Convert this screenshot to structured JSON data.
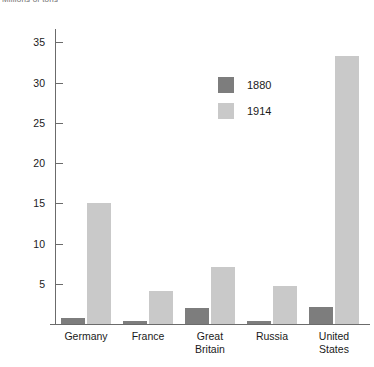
{
  "chart_data": {
    "type": "bar",
    "title": "Millions of tons",
    "xlabel": "",
    "ylabel": "",
    "ylim": [
      0,
      37
    ],
    "grid": false,
    "legend_position": "inside-top-left",
    "yticks": [
      5,
      10,
      15,
      20,
      25,
      30,
      35
    ],
    "categories": [
      "Germany",
      "France",
      "Great\nBritain",
      "Russia",
      "United\nStates"
    ],
    "series": [
      {
        "name": "1880",
        "color": "#7d7d7d",
        "values": [
          0.7,
          0.4,
          2.0,
          0.4,
          2.1
        ]
      },
      {
        "name": "1914",
        "color": "#c9c9c9",
        "values": [
          15.0,
          4.1,
          7.1,
          4.7,
          33.3
        ]
      }
    ]
  },
  "legend": {
    "items": [
      {
        "label": "1880",
        "color": "#7d7d7d"
      },
      {
        "label": "1914",
        "color": "#c9c9c9"
      }
    ]
  },
  "axis": {
    "y_tick_labels": [
      "35",
      "30",
      "25",
      "20",
      "15",
      "10",
      "5"
    ]
  },
  "categories": [
    {
      "line1": "Germany",
      "line2": ""
    },
    {
      "line1": "France",
      "line2": ""
    },
    {
      "line1": "Great",
      "line2": "Britain"
    },
    {
      "line1": "Russia",
      "line2": ""
    },
    {
      "line1": "United",
      "line2": "States"
    }
  ],
  "colors": {
    "series_1880": "#7d7d7d",
    "series_1914": "#c9c9c9",
    "axis": "#6b6b6b",
    "text": "#1a1a1a",
    "background": "#ffffff"
  }
}
